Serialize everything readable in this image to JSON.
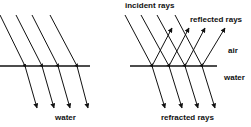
{
  "diagram": {
    "left_panel": {
      "labels": {
        "medium_below": "water"
      },
      "surface": {
        "x1": 0,
        "x2": 90,
        "y": 66
      },
      "rays": [
        {
          "start": [
            0,
            15
          ],
          "hit": [
            25,
            66
          ],
          "end": [
            37,
            108
          ]
        },
        {
          "start": [
            16,
            15
          ],
          "hit": [
            42,
            66
          ],
          "end": [
            54,
            108
          ]
        },
        {
          "start": [
            32,
            15
          ],
          "hit": [
            58,
            66
          ],
          "end": [
            70,
            108
          ]
        },
        {
          "start": [
            50,
            15
          ],
          "hit": [
            77,
            66
          ],
          "end": [
            88,
            108
          ]
        }
      ]
    },
    "right_panel": {
      "labels": {
        "incident": "incident rays",
        "reflected": "reflected rays",
        "air": "air",
        "water": "water",
        "refracted": "refracted rays"
      },
      "surface": {
        "x1": 130,
        "x2": 217,
        "y": 66
      },
      "rays": [
        {
          "start": [
            125,
            15
          ],
          "hit": [
            152,
            66
          ],
          "reflect_end": [
            172,
            28
          ],
          "refract_end": [
            165,
            108
          ]
        },
        {
          "start": [
            141,
            15
          ],
          "hit": [
            169,
            66
          ],
          "reflect_end": [
            189,
            28
          ],
          "refract_end": [
            182,
            108
          ]
        },
        {
          "start": [
            157,
            15
          ],
          "hit": [
            185,
            66
          ],
          "reflect_end": [
            205,
            28
          ],
          "refract_end": [
            198,
            108
          ]
        },
        {
          "start": [
            175,
            15
          ],
          "hit": [
            202,
            66
          ],
          "reflect_end": [
            225,
            28
          ],
          "refract_end": [
            215,
            108
          ]
        }
      ]
    },
    "colors": {
      "line": "#111111",
      "background": "#ffffff"
    }
  }
}
